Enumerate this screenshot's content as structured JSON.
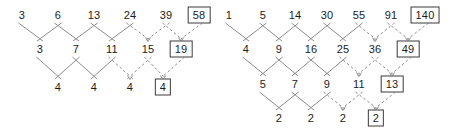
{
  "figure": {
    "width": 464,
    "height": 131,
    "background_color": "#ffffff",
    "edge_color": "#8c8c8c",
    "boxed_border_color": "#3a3a3a",
    "text_color": "#1c1c1c"
  },
  "diagrams": [
    {
      "id": "left-triangle",
      "name": "left-difference-triangle",
      "row_count": 3,
      "rows": [
        {
          "index": 0,
          "y": 15,
          "values": [
            "3",
            "6",
            "13",
            "24",
            "39",
            "58"
          ],
          "xs": [
            22,
            58,
            94,
            130,
            166,
            199
          ],
          "boxed": [
            false,
            false,
            false,
            false,
            false,
            true
          ],
          "dashed_from": 4
        },
        {
          "index": 1,
          "y": 49,
          "values": [
            "3",
            "7",
            "11",
            "15",
            "19"
          ],
          "xs": [
            40,
            76,
            112,
            148,
            181
          ],
          "boxed": [
            false,
            false,
            false,
            false,
            true
          ],
          "dashed_from": 3
        },
        {
          "index": 2,
          "y": 87,
          "values": [
            "4",
            "4",
            "4",
            "4"
          ],
          "xs": [
            58,
            94,
            130,
            163
          ],
          "boxed": [
            false,
            false,
            false,
            true
          ],
          "dashed_from": 2
        }
      ]
    },
    {
      "id": "right-triangle",
      "name": "right-difference-triangle",
      "row_count": 4,
      "rows": [
        {
          "index": 0,
          "y": 15,
          "values": [
            "1",
            "5",
            "14",
            "30",
            "55",
            "91",
            "140"
          ],
          "xs": [
            4,
            38,
            70,
            102,
            134,
            166,
            200
          ],
          "boxed": [
            false,
            false,
            false,
            false,
            false,
            false,
            true
          ],
          "dashed_from": 5
        },
        {
          "index": 1,
          "y": 49,
          "values": [
            "4",
            "9",
            "16",
            "25",
            "36",
            "49"
          ],
          "xs": [
            21,
            54,
            86,
            118,
            150,
            183
          ],
          "boxed": [
            false,
            false,
            false,
            false,
            false,
            true
          ],
          "dashed_from": 4
        },
        {
          "index": 2,
          "y": 84,
          "values": [
            "5",
            "7",
            "9",
            "11",
            "13"
          ],
          "xs": [
            38,
            70,
            102,
            134,
            167
          ],
          "boxed": [
            false,
            false,
            false,
            false,
            true
          ],
          "dashed_from": 3
        },
        {
          "index": 3,
          "y": 118,
          "values": [
            "2",
            "2",
            "2",
            "2"
          ],
          "xs": [
            54,
            86,
            118,
            151
          ],
          "boxed": [
            false,
            false,
            false,
            true
          ],
          "dashed_from": 2
        }
      ]
    }
  ],
  "chart_data": {
    "type": "diagram",
    "subtype": "difference-triangle",
    "triangles": [
      {
        "name": "left",
        "sequence": [
          3,
          6,
          13,
          24,
          39,
          58
        ],
        "first_differences": [
          3,
          7,
          11,
          15,
          19
        ],
        "second_differences": [
          4,
          4,
          4,
          4
        ],
        "predicted": {
          "row0": 58,
          "row1": 19,
          "row2": 4
        },
        "known_terms": [
          3,
          6,
          13,
          24,
          39
        ]
      },
      {
        "name": "right",
        "sequence": [
          1,
          5,
          14,
          30,
          55,
          91,
          140
        ],
        "first_differences": [
          4,
          9,
          16,
          25,
          36,
          49
        ],
        "second_differences": [
          5,
          7,
          9,
          11,
          13
        ],
        "third_differences": [
          2,
          2,
          2,
          2
        ],
        "predicted": {
          "row0": 140,
          "row1": 49,
          "row2": 13,
          "row3": 2
        },
        "known_terms": [
          1,
          5,
          14,
          30,
          55,
          91
        ]
      }
    ],
    "legend": [
      "solid edge = computed difference",
      "dashed edge = extrapolated",
      "boxed value = predicted term"
    ]
  }
}
